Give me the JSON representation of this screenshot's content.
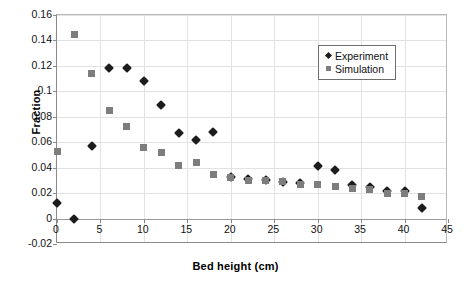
{
  "chart_data": {
    "type": "scatter",
    "title": "",
    "xlabel": "Bed height (cm)",
    "ylabel": "Fraction",
    "xlim": [
      0,
      45
    ],
    "ylim": [
      -0.02,
      0.16
    ],
    "xticks": [
      0,
      5,
      10,
      15,
      20,
      25,
      30,
      35,
      40,
      45
    ],
    "xtick_labels": [
      "0",
      "5",
      "10",
      "15",
      "20",
      "25",
      "30",
      "35",
      "40",
      "45"
    ],
    "yticks": [
      -0.02,
      0,
      0.02,
      0.04,
      0.06,
      0.08,
      0.1,
      0.12,
      0.14,
      0.16
    ],
    "ytick_labels": [
      "-0.02",
      "0",
      "0.02",
      "0.04",
      "0.06",
      "0.08",
      "0.1",
      "0.12",
      "0.14",
      "0.16"
    ],
    "grid": true,
    "legend_position": "top-right",
    "series": [
      {
        "name": "Experiment",
        "marker": "diamond",
        "color": "#1c1c1c",
        "x": [
          0,
          2,
          4,
          6,
          8,
          10,
          12,
          14,
          16,
          18,
          20,
          22,
          24,
          26,
          28,
          30,
          32,
          34,
          36,
          38,
          40,
          42
        ],
        "y": [
          0.012,
          0.0,
          0.057,
          0.118,
          0.118,
          0.108,
          0.089,
          0.067,
          0.062,
          0.068,
          0.033,
          0.031,
          0.03,
          0.029,
          0.028,
          0.041,
          0.038,
          0.026,
          0.025,
          0.022,
          0.022,
          0.008
        ]
      },
      {
        "name": "Simulation",
        "marker": "square",
        "color": "#7d7d7d",
        "x": [
          0,
          2,
          4,
          6,
          8,
          10,
          12,
          14,
          16,
          18,
          20,
          22,
          24,
          26,
          28,
          30,
          32,
          34,
          36,
          38,
          40,
          42
        ],
        "y": [
          0.053,
          0.145,
          0.114,
          0.085,
          0.072,
          0.056,
          0.052,
          0.042,
          0.044,
          0.035,
          0.032,
          0.03,
          0.03,
          0.029,
          0.027,
          0.027,
          0.025,
          0.024,
          0.023,
          0.02,
          0.02,
          0.017
        ]
      }
    ]
  },
  "legend": {
    "entries": [
      {
        "label": "Experiment",
        "marker": "diamond-marker-icon"
      },
      {
        "label": "Simulation",
        "marker": "square-marker-icon"
      }
    ]
  }
}
